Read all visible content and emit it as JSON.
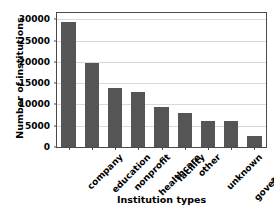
{
  "chart_data": {
    "type": "bar",
    "title": "",
    "xlabel": "Institution types",
    "ylabel": "Number of institutions",
    "categories": [
      "company",
      "education",
      "nonprofit",
      "healthcare",
      "facility",
      "other",
      "unknown",
      "government",
      "archive"
    ],
    "values": [
      29500,
      19800,
      13900,
      13000,
      9300,
      8100,
      6100,
      6100,
      2700
    ],
    "ylim": [
      0,
      31500
    ],
    "yticks": [
      0,
      5000,
      10000,
      15000,
      20000,
      25000,
      30000
    ],
    "ytick_labels": [
      "0",
      "5000",
      "10000",
      "15000",
      "20000",
      "25000",
      "30000"
    ],
    "grid": true,
    "legend": false,
    "bar_color": "#555555",
    "grid_color": "#d9d9d9",
    "axis_color": "#4a4a4a"
  }
}
